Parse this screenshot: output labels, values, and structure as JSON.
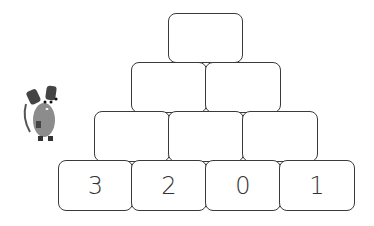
{
  "pyramid": {
    "rows": [
      {
        "cells": [
          ""
        ]
      },
      {
        "cells": [
          "",
          ""
        ]
      },
      {
        "cells": [
          "",
          "",
          ""
        ]
      },
      {
        "cells": [
          "3",
          "2",
          "0",
          "1"
        ]
      }
    ]
  },
  "mascot": {
    "icon": "mouse-icon"
  },
  "colors": {
    "border": "#3a3a3a",
    "mouse": "#8c8c8c",
    "mouse_dark": "#444444"
  }
}
